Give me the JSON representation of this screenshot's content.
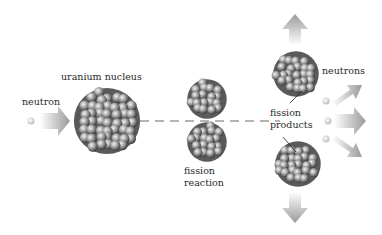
{
  "diagram": {
    "labels": {
      "neutron": "neutron",
      "uranium_nucleus": "uranium nucleus",
      "fission_reaction_1": "fission",
      "fission_reaction_2": "reaction",
      "neutrons": "neutrons",
      "fission_products_1": "fission",
      "fission_products_2": "products"
    },
    "colors": {
      "nucleon_dark": "#4a4a4a",
      "nucleon_light": "#d8d8d8",
      "arrow": "#a8a8a8",
      "dash": "#b0b0b0",
      "background": "#ffffff"
    }
  }
}
